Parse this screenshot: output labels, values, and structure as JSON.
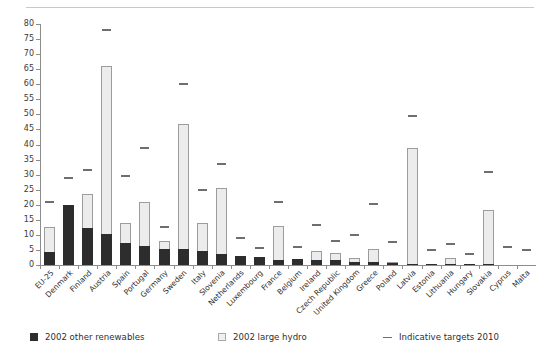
{
  "chart_data": {
    "type": "bar",
    "stacked": true,
    "title": "",
    "subtitle": "",
    "xlabel": "",
    "ylabel": "",
    "ylim": [
      0,
      80
    ],
    "ytick_step": 5,
    "grid": false,
    "legend_position": "bottom",
    "yticks": [
      "80",
      "75",
      "70",
      "65",
      "60",
      "55",
      "50",
      "45",
      "40",
      "35",
      "30",
      "25",
      "20",
      "15",
      "10",
      "5",
      "0"
    ],
    "categories": [
      "EU-25",
      "Denmark",
      "Finland",
      "Austria",
      "Spain",
      "Portugal",
      "Germany",
      "Sweden",
      "Italy",
      "Slovenia",
      "Netherlands",
      "Luxembourg",
      "France",
      "Belgium",
      "Ireland",
      "Czech Republic",
      "United Kingdom",
      "Greece",
      "Poland",
      "Latvia",
      "Estonia",
      "Lithuania",
      "Hungary",
      "Slovakia",
      "Cyprus",
      "Malta"
    ],
    "series": [
      {
        "name": "2002 other renewables",
        "color": "#2d2d2d",
        "values": [
          4.4,
          20.0,
          12.2,
          10.3,
          7.3,
          6.4,
          5.4,
          5.2,
          4.7,
          3.6,
          3.1,
          2.5,
          1.8,
          2.0,
          1.6,
          1.5,
          1.1,
          0.9,
          0.6,
          0.3,
          0.2,
          0.3,
          0.2,
          0.1,
          0.0,
          0.0
        ]
      },
      {
        "name": "2002  large hydro",
        "color": "#ececec",
        "values": [
          8.2,
          0.0,
          11.3,
          55.7,
          6.6,
          14.4,
          2.5,
          41.5,
          9.4,
          21.9,
          0.0,
          0.0,
          11.1,
          0.0,
          3.2,
          2.6,
          1.2,
          4.4,
          0.5,
          38.5,
          0.0,
          2.1,
          0.0,
          17.8,
          0.0,
          0.0
        ]
      }
    ],
    "markers": {
      "name": "Indicative targets 2010",
      "color": "#6e6e6e",
      "values": [
        21.0,
        29.0,
        31.5,
        78.1,
        29.4,
        39.0,
        12.5,
        60.0,
        25.0,
        33.6,
        9.0,
        5.7,
        21.0,
        6.0,
        13.2,
        8.0,
        10.0,
        20.1,
        7.5,
        49.3,
        5.1,
        7.0,
        3.6,
        31.0,
        6.0,
        5.0
      ]
    },
    "legend": [
      {
        "label": "2002 other renewables",
        "swatch": "dark-square"
      },
      {
        "label": "2002  large hydro",
        "swatch": "light-square"
      },
      {
        "label": "Indicative targets 2010",
        "swatch": "dash-line"
      }
    ]
  }
}
